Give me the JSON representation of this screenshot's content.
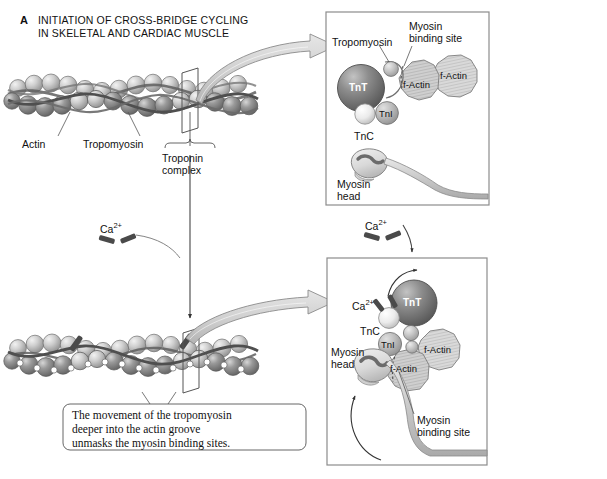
{
  "figure": {
    "panel_letter": "A",
    "title_line1": "INITIATION OF CROSS-BRIDGE CYCLING",
    "title_line2": "IN SKELETAL AND CARDIAC MUSCLE"
  },
  "filament_labels": {
    "actin": "Actin",
    "tropomyosin": "Tropomyosin",
    "troponin_line1": "Troponin",
    "troponin_line2": "complex"
  },
  "calcium": {
    "symbol": "Ca",
    "charge": "2+"
  },
  "caption": {
    "line1": "The movement of the tropomyosin",
    "line2": "deeper into the actin groove",
    "line3": "unmasks the myosin binding sites."
  },
  "panel_top": {
    "tropomyosin": "Tropomyosin",
    "binding_site_line1": "Myosin",
    "binding_site_line2": "binding site",
    "tnt": "TnT",
    "tnc": "TnC",
    "tni": "TnI",
    "factin_inner": "f-Actin",
    "factin_outer": "f-Actin",
    "myosin_head_line1": "Myosin",
    "myosin_head_line2": "head"
  },
  "panel_bottom": {
    "calcium_symbol": "Ca",
    "calcium_charge": "2+",
    "tnt": "TnT",
    "tnc": "TnC",
    "tni": "TnI",
    "factin_inner": "f-Actin",
    "factin_outer": "f-Actin",
    "myosin_head_line1": "Myosin",
    "myosin_head_line2": "head",
    "binding_site_line1": "Myosin",
    "binding_site_line2": "binding site"
  },
  "colors": {
    "background": "#ffffff",
    "panel_border": "#8c8c8c",
    "ink": "#1a1a1a",
    "tnt_dark": "#767676",
    "tnc_light": "#e3e3e3",
    "tni_mid": "#b5b5b5",
    "factin_fill": "#c9c9c9",
    "actin_sphere": "#bdbdbd",
    "arrow_fill": "#d2d2d2",
    "calcium_mark": "#4a4a4a",
    "myosin_fill": "#dcdcdc",
    "myosin_squiggle": "#6b6b6b"
  }
}
